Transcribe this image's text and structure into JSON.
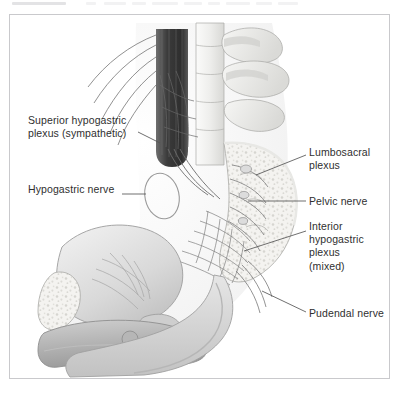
{
  "figure": {
    "type": "medical-illustration",
    "border_color": "#c9c9cc",
    "background_color": "#ffffff",
    "ink_color": "#2f2f2f",
    "palette": {
      "bone_light": "#f2f2f1",
      "bone_mid": "#dcdcda",
      "tissue_light": "#ececeb",
      "tissue_mid": "#cfcfcf",
      "tissue_dark": "#9e9e9e",
      "vessel_dark": "#4a4a4a",
      "outline": "#8c8c8c"
    },
    "labels": [
      {
        "id": "superior-hypogastric-plexus",
        "lines": [
          "Superior hypogastric",
          "plexus (sympathetic)"
        ],
        "side": "left"
      },
      {
        "id": "hypogastric-nerve",
        "lines": [
          "Hypogastric nerve"
        ],
        "side": "left"
      },
      {
        "id": "lumbosacral-plexus",
        "lines": [
          "Lumbosacral",
          "plexus"
        ],
        "side": "right"
      },
      {
        "id": "pelvic-nerve",
        "lines": [
          "Pelvic nerve"
        ],
        "side": "right"
      },
      {
        "id": "inferior-hypogastric-plexus",
        "lines": [
          "Interior",
          "hypogastric",
          "plexus",
          "(mixed)"
        ],
        "side": "right"
      },
      {
        "id": "pudendal-nerve",
        "lines": [
          "Pudendal nerve"
        ],
        "side": "right"
      }
    ],
    "label_text": {
      "superior_l1": "Superior hypogastric",
      "superior_l2": "plexus (sympathetic)",
      "hypogastric": "Hypogastric nerve",
      "lumbosacral_l1": "Lumbosacral",
      "lumbosacral_l2": "plexus",
      "pelvic": "Pelvic nerve",
      "inferior_l1": "Interior",
      "inferior_l2": "hypogastric",
      "inferior_l3": "plexus",
      "inferior_l4": "(mixed)",
      "pudendal": "Pudendal nerve"
    }
  }
}
